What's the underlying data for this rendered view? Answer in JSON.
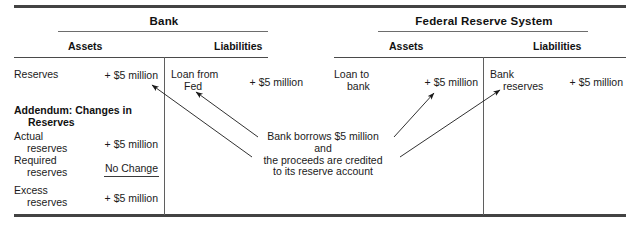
{
  "figure": {
    "type": "t-account-diagram"
  },
  "tables": [
    {
      "title": "Bank",
      "columns": [
        "Assets",
        "Liabilities"
      ],
      "assets": [
        {
          "label": "Reserves",
          "label_line2": "",
          "amount": "+ $5 million"
        }
      ],
      "liabilities": [
        {
          "label": "Loan from",
          "label_line2": "Fed",
          "amount": "+ $5 million"
        }
      ]
    },
    {
      "title": "Federal Reserve System",
      "columns": [
        "Assets",
        "Liabilities"
      ],
      "assets": [
        {
          "label": "Loan to",
          "label_line2": "bank",
          "amount": "+ $5 million"
        }
      ],
      "liabilities": [
        {
          "label": "Bank",
          "label_line2": "reserves",
          "amount": "+ $5 million"
        }
      ]
    }
  ],
  "addendum": {
    "title_line1": "Addendum: Changes in",
    "title_line2": "Reserves",
    "rows": [
      {
        "label": "Actual",
        "label_line2": "reserves",
        "amount": "+ $5 million",
        "underlined": false
      },
      {
        "label": "Required",
        "label_line2": "reserves",
        "amount": "No Change",
        "underlined": true
      },
      {
        "label": "Excess",
        "label_line2": "reserves",
        "amount": "+ $5 million",
        "underlined": false
      }
    ]
  },
  "annotation": {
    "line1": "Bank borrows $5 million",
    "line2": "and",
    "line3": "the proceeds are credited",
    "line4": "to its reserve account"
  },
  "colors": {
    "ink": "#1a1a1a",
    "rule": "#3a3a3a",
    "thin_rule": "#6d6d6d"
  }
}
